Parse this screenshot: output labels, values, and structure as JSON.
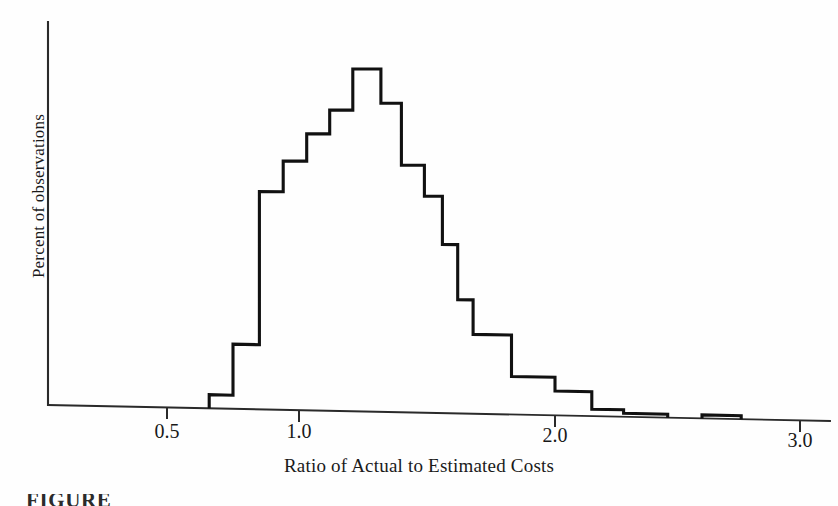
{
  "figure": {
    "caption_fragment": "FIGURE"
  },
  "chart_data": {
    "type": "bar",
    "title": "",
    "subtitle": "",
    "xlabel": "Ratio of Actual to Estimated Costs",
    "ylabel": "Percent of observations",
    "grid": false,
    "legend": null,
    "xlim": [
      0.25,
      3.05
    ],
    "ylim": [
      0,
      100
    ],
    "x_tick_labels": [
      "0.5",
      "1.0",
      "2.0",
      "3.0"
    ],
    "x_tick_values": [
      0.5,
      1.0,
      2.0,
      3.0
    ],
    "y_tick_labels": [],
    "y_tick_values": [],
    "note": "Histogram outline only; y axis is unlabeled relative percent of observations.",
    "bin_edges": [
      0.66,
      0.75,
      0.85,
      0.94,
      1.03,
      1.12,
      1.21,
      1.32,
      1.4,
      1.49,
      1.56,
      1.62,
      1.68,
      1.83,
      2.0,
      2.15,
      2.28,
      2.46,
      2.6,
      2.76
    ],
    "bins": [
      {
        "x0": 0.66,
        "x1": 0.75,
        "value": 4
      },
      {
        "x0": 0.75,
        "x1": 0.85,
        "value": 19
      },
      {
        "x0": 0.85,
        "x1": 0.94,
        "value": 64
      },
      {
        "x0": 0.94,
        "x1": 1.03,
        "value": 73
      },
      {
        "x0": 1.03,
        "x1": 1.12,
        "value": 81
      },
      {
        "x0": 1.12,
        "x1": 1.21,
        "value": 88
      },
      {
        "x0": 1.21,
        "x1": 1.32,
        "value": 100
      },
      {
        "x0": 1.32,
        "x1": 1.4,
        "value": 90
      },
      {
        "x0": 1.4,
        "x1": 1.49,
        "value": 72
      },
      {
        "x0": 1.49,
        "x1": 1.56,
        "value": 63
      },
      {
        "x0": 1.56,
        "x1": 1.62,
        "value": 49
      },
      {
        "x0": 1.62,
        "x1": 1.68,
        "value": 33
      },
      {
        "x0": 1.68,
        "x1": 1.83,
        "value": 23
      },
      {
        "x0": 1.83,
        "x1": 2.0,
        "value": 11
      },
      {
        "x0": 2.0,
        "x1": 2.15,
        "value": 7
      },
      {
        "x0": 2.15,
        "x1": 2.28,
        "value": 2
      },
      {
        "x0": 2.28,
        "x1": 2.46,
        "value": 1
      },
      {
        "x0": 2.46,
        "x1": 2.6,
        "value": 0
      },
      {
        "x0": 2.6,
        "x1": 2.76,
        "value": 1
      }
    ],
    "colors": {
      "outline": "#111111",
      "axis": "#2a2a2a",
      "background": "#ffffff"
    }
  }
}
